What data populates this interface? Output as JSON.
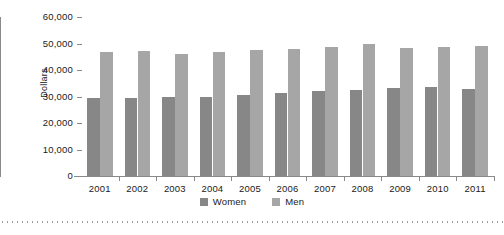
{
  "chart_data": {
    "type": "bar",
    "title": "",
    "subtitle": "",
    "xlabel": "",
    "ylabel": "Dollars",
    "categories": [
      "2001",
      "2002",
      "2003",
      "2004",
      "2005",
      "2006",
      "2007",
      "2008",
      "2009",
      "2010",
      "2011"
    ],
    "series": [
      {
        "name": "Women",
        "color": "#878787",
        "values": [
          29300,
          29500,
          29700,
          30000,
          30600,
          31200,
          32200,
          32500,
          33300,
          33400,
          32900
        ]
      },
      {
        "name": "Men",
        "color": "#a6a6a6",
        "values": [
          46700,
          47000,
          46200,
          46800,
          47500,
          47800,
          48800,
          49700,
          48400,
          48800,
          49100
        ]
      }
    ],
    "ylim": [
      0,
      60000
    ],
    "ytick_values": [
      0,
      10000,
      20000,
      30000,
      40000,
      50000,
      60000
    ],
    "ytick_labels": [
      "0",
      "10,000",
      "20,000",
      "30,000",
      "40,000",
      "50,000",
      "60,000"
    ],
    "grid": false,
    "legend_position": "bottom"
  },
  "legend": {
    "items": [
      {
        "label": "Women",
        "swatch": "women-swatch-icon"
      },
      {
        "label": "Men",
        "swatch": "men-swatch-icon"
      }
    ]
  }
}
